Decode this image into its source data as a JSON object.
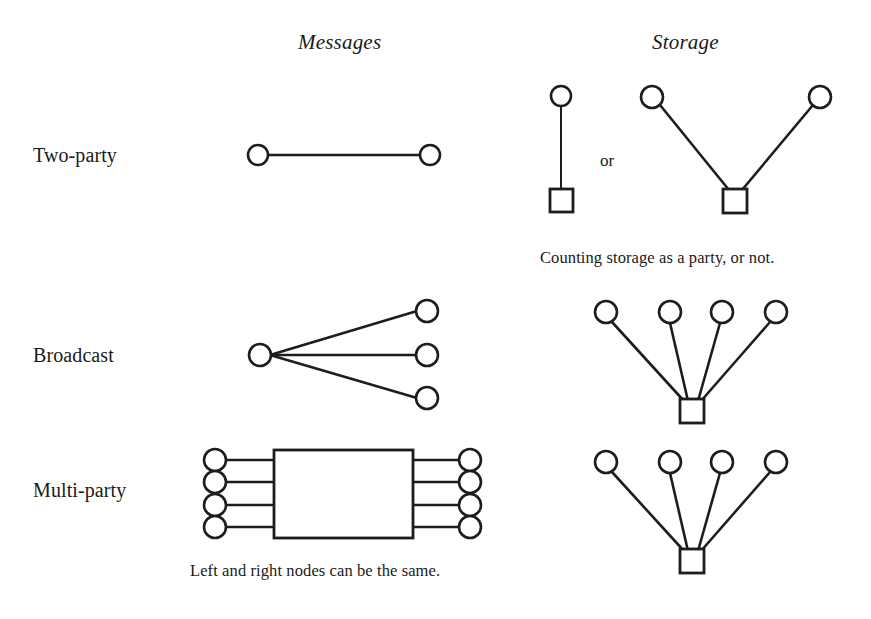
{
  "figure": {
    "columns": [
      {
        "id": "messages",
        "label": "Messages",
        "x": 347,
        "y": 42
      },
      {
        "id": "storage",
        "label": "Storage",
        "x": 690,
        "y": 42
      }
    ],
    "rows": [
      {
        "id": "two-party",
        "label": "Two-party",
        "x": 33,
        "y": 155
      },
      {
        "id": "broadcast",
        "label": "Broadcast",
        "x": 33,
        "y": 355
      },
      {
        "id": "multi-party",
        "label": "Multi-party",
        "x": 33,
        "y": 490
      }
    ],
    "connector_label": {
      "text": "or",
      "x": 608,
      "y": 162
    },
    "captions": [
      {
        "id": "storage-caption",
        "text": "Counting storage as a party, or not.",
        "x": 540,
        "y": 258
      },
      {
        "id": "messages-caption",
        "text": "Left and right nodes can be the same.",
        "x": 190,
        "y": 571
      }
    ],
    "colors": {
      "stroke": "#1d1d1d",
      "fill": "#ffffff",
      "background": "#ffffff",
      "text": "#1a1a1a"
    },
    "diagrams": {
      "two_party_messages": {
        "type": "link",
        "circles": [
          {
            "cx": 258,
            "cy": 155,
            "r": 10
          },
          {
            "cx": 430,
            "cy": 155,
            "r": 10
          }
        ],
        "edges": [
          {
            "x1": 268,
            "y1": 155,
            "x2": 420,
            "y2": 155
          }
        ]
      },
      "two_party_storage_a": {
        "type": "party-storage-pair",
        "circles": [
          {
            "cx": 561,
            "cy": 96,
            "r": 10
          }
        ],
        "squares": [
          {
            "x": 550,
            "y": 189,
            "w": 23,
            "h": 23
          }
        ],
        "edges": [
          {
            "x1": 561,
            "y1": 106,
            "x2": 561,
            "y2": 189
          }
        ]
      },
      "two_party_storage_b": {
        "type": "v-shape",
        "circles": [
          {
            "cx": 652,
            "cy": 97,
            "r": 11
          },
          {
            "cx": 820,
            "cy": 97,
            "r": 11
          }
        ],
        "squares": [
          {
            "x": 723,
            "y": 189,
            "w": 24,
            "h": 24
          }
        ],
        "edges": [
          {
            "x1": 660,
            "y1": 105,
            "x2": 727,
            "y2": 189
          },
          {
            "x1": 813,
            "y1": 105,
            "x2": 744,
            "y2": 189
          }
        ]
      },
      "broadcast_messages": {
        "type": "fan-right",
        "circles": [
          {
            "cx": 260,
            "cy": 355,
            "r": 11
          },
          {
            "cx": 427,
            "cy": 311,
            "r": 11
          },
          {
            "cx": 427,
            "cy": 355,
            "r": 11
          },
          {
            "cx": 427,
            "cy": 398,
            "r": 11
          }
        ],
        "edges": [
          {
            "x1": 271,
            "y1": 355,
            "x2": 416,
            "y2": 311
          },
          {
            "x1": 271,
            "y1": 355,
            "x2": 416,
            "y2": 355
          },
          {
            "x1": 271,
            "y1": 355,
            "x2": 416,
            "y2": 398
          }
        ]
      },
      "broadcast_storage": {
        "type": "fan-up",
        "circles": [
          {
            "cx": 606,
            "cy": 312,
            "r": 11
          },
          {
            "cx": 670,
            "cy": 312,
            "r": 11
          },
          {
            "cx": 722,
            "cy": 312,
            "r": 11
          },
          {
            "cx": 776,
            "cy": 312,
            "r": 11
          }
        ],
        "squares": [
          {
            "x": 680,
            "y": 399,
            "w": 24,
            "h": 24
          }
        ],
        "edges": [
          {
            "x1": 612,
            "y1": 322,
            "x2": 683,
            "y2": 399
          },
          {
            "x1": 670,
            "y1": 323,
            "x2": 688,
            "y2": 399
          },
          {
            "x1": 720,
            "y1": 323,
            "x2": 698,
            "y2": 399
          },
          {
            "x1": 770,
            "y1": 322,
            "x2": 702,
            "y2": 399
          }
        ]
      },
      "multi_party_messages": {
        "type": "bipartite-box",
        "box": {
          "x": 274,
          "y": 450,
          "w": 139,
          "h": 88
        },
        "circles_left": [
          {
            "cx": 215,
            "cy": 460,
            "r": 11
          },
          {
            "cx": 215,
            "cy": 482,
            "r": 11
          },
          {
            "cx": 215,
            "cy": 505,
            "r": 11
          },
          {
            "cx": 215,
            "cy": 527,
            "r": 11
          }
        ],
        "circles_right": [
          {
            "cx": 470,
            "cy": 460,
            "r": 11
          },
          {
            "cx": 470,
            "cy": 482,
            "r": 11
          },
          {
            "cx": 470,
            "cy": 505,
            "r": 11
          },
          {
            "cx": 470,
            "cy": 527,
            "r": 11
          }
        ],
        "edges": [
          {
            "x1": 226,
            "y1": 460,
            "x2": 274,
            "y2": 460
          },
          {
            "x1": 226,
            "y1": 482,
            "x2": 274,
            "y2": 482
          },
          {
            "x1": 226,
            "y1": 505,
            "x2": 274,
            "y2": 505
          },
          {
            "x1": 226,
            "y1": 527,
            "x2": 274,
            "y2": 527
          },
          {
            "x1": 413,
            "y1": 460,
            "x2": 459,
            "y2": 460
          },
          {
            "x1": 413,
            "y1": 482,
            "x2": 459,
            "y2": 482
          },
          {
            "x1": 413,
            "y1": 505,
            "x2": 459,
            "y2": 505
          },
          {
            "x1": 413,
            "y1": 527,
            "x2": 459,
            "y2": 527
          }
        ]
      },
      "multi_party_storage": {
        "type": "fan-up",
        "circles": [
          {
            "cx": 606,
            "cy": 462,
            "r": 11
          },
          {
            "cx": 670,
            "cy": 462,
            "r": 11
          },
          {
            "cx": 722,
            "cy": 462,
            "r": 11
          },
          {
            "cx": 776,
            "cy": 462,
            "r": 11
          }
        ],
        "squares": [
          {
            "x": 680,
            "y": 549,
            "w": 24,
            "h": 24
          }
        ],
        "edges": [
          {
            "x1": 612,
            "y1": 472,
            "x2": 683,
            "y2": 549
          },
          {
            "x1": 670,
            "y1": 473,
            "x2": 688,
            "y2": 549
          },
          {
            "x1": 720,
            "y1": 473,
            "x2": 698,
            "y2": 549
          },
          {
            "x1": 770,
            "y1": 472,
            "x2": 702,
            "y2": 549
          }
        ]
      }
    }
  }
}
